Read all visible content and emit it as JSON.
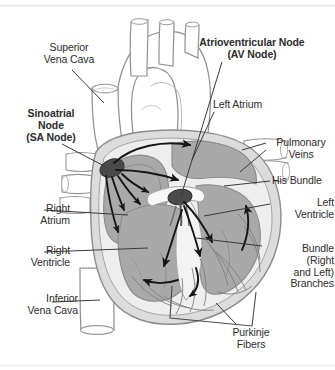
{
  "figure": {
    "colors": {
      "background": "#ffffff",
      "outline": "#8d8d8d",
      "chamber_fill": "#a9a9a9",
      "myocardium_fill": "#d4d4d4",
      "vessel_fill": "#ffffff",
      "node_fill": "#4a4a4a",
      "arrow": "#151515",
      "label_text": "#2d2d2d",
      "leader_line": "#3a3a3a",
      "frame_line": "#e8e8e8"
    }
  },
  "labels": [
    {
      "id": "lbl-svc",
      "name": "label-superior-vena-cava",
      "text": "Superior\nVena Cava",
      "bold": false,
      "align": "center"
    },
    {
      "id": "lbl-sa",
      "name": "label-sinoatrial-node",
      "text": "Sinoatrial\nNode\n(SA Node)",
      "bold": true,
      "align": "center"
    },
    {
      "id": "lbl-av",
      "name": "label-atrioventricular-node",
      "text": "Atrioventricular Node\n(AV Node)",
      "bold": true,
      "align": "center"
    },
    {
      "id": "lbl-la",
      "name": "label-left-atrium",
      "text": "Left Atrium",
      "bold": false,
      "align": "left"
    },
    {
      "id": "lbl-pv",
      "name": "label-pulmonary-veins",
      "text": "Pulmonary\nVeins",
      "bold": false,
      "align": "center"
    },
    {
      "id": "lbl-his",
      "name": "label-his-bundle",
      "text": "His Bundle",
      "bold": false,
      "align": "left"
    },
    {
      "id": "lbl-lv",
      "name": "label-left-ventricle",
      "text": "Left\nVentricle",
      "bold": false,
      "align": "right"
    },
    {
      "id": "lbl-ra",
      "name": "label-right-atrium",
      "text": "Right\nAtrium",
      "bold": false,
      "align": "right"
    },
    {
      "id": "lbl-rv",
      "name": "label-right-ventricle",
      "text": "Right\nVentricle",
      "bold": false,
      "align": "right"
    },
    {
      "id": "lbl-ivc",
      "name": "label-inferior-vena-cava",
      "text": "Inferior\nVena Cava",
      "bold": false,
      "align": "right"
    },
    {
      "id": "lbl-bundle",
      "name": "label-bundle-branches",
      "text": "Bundle\n(Right\nand Left)\nBranches",
      "bold": false,
      "align": "right"
    },
    {
      "id": "lbl-pf",
      "name": "label-purkinje-fibers",
      "text": "Purkinje\nFibers",
      "bold": false,
      "align": "center"
    }
  ],
  "anatomy_parts": [
    "aortic arch",
    "brachiocephalic branches",
    "superior vena cava",
    "inferior vena cava",
    "pulmonary veins",
    "right atrium",
    "left atrium",
    "right ventricle",
    "left ventricle",
    "interventricular septum",
    "sinoatrial node",
    "atrioventricular node",
    "his bundle",
    "right bundle branch",
    "left bundle branch",
    "purkinje fibers"
  ],
  "conduction_arrows": [
    "SA node to left atrium (upper)",
    "SA node to AV node (internodal)",
    "SA node down right atrial wall",
    "SA node to right atrium lower",
    "AV node to His bundle",
    "His bundle down septum",
    "left bundle branch into left ventricle",
    "left ventricle apex upward",
    "right bundle branch to apex",
    "apex toward right ventricle free wall"
  ]
}
